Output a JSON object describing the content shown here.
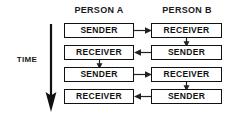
{
  "diagram": {
    "title_present": false,
    "axis_label": "TIME",
    "axis_direction": "down",
    "columns": [
      {
        "id": "person-a",
        "header": "PERSON A"
      },
      {
        "id": "person-b",
        "header": "PERSON B"
      }
    ],
    "rows": [
      {
        "index": 1,
        "left_role": "SENDER",
        "right_role": "RECEIVER",
        "arrow_direction": "right"
      },
      {
        "index": 2,
        "left_role": "RECEIVER",
        "right_role": "SENDER",
        "arrow_direction": "left"
      },
      {
        "index": 3,
        "left_role": "SENDER",
        "right_role": "RECEIVER",
        "arrow_direction": "right"
      },
      {
        "index": 4,
        "left_role": "RECEIVER",
        "right_role": "SENDER",
        "arrow_direction": "left"
      }
    ],
    "connectors": [
      {
        "id": "conn-r1-r2",
        "column": "person-b",
        "from_row": 1,
        "to_row": 2,
        "direction": "down"
      },
      {
        "id": "conn-r2-r3",
        "column": "person-a",
        "from_row": 2,
        "to_row": 3,
        "direction": "down"
      },
      {
        "id": "conn-r3-r4",
        "column": "person-b",
        "from_row": 3,
        "to_row": 4,
        "direction": "down"
      }
    ],
    "colors": {
      "background": "#ffffff",
      "stroke": "#111111",
      "text": "#1a1a1a",
      "arrow": "#222222"
    }
  }
}
